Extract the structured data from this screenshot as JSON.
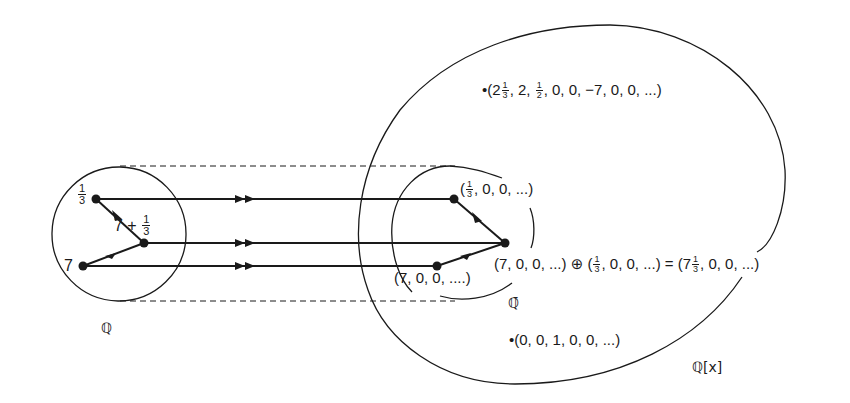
{
  "diagram": {
    "sets": {
      "Q": {
        "label": "ℚ",
        "description": "rational numbers"
      },
      "Q_bar": {
        "label": "ℚ̄",
        "description": "image of Q in Q[x]"
      },
      "Q_x": {
        "label": "ℚ[x]",
        "description": "polynomial ring as sequences"
      }
    },
    "left_points": {
      "one_third": {
        "num": "1",
        "den": "3"
      },
      "seven_plus_third": {
        "prefix": "7 + ",
        "num": "1",
        "den": "3"
      },
      "seven": {
        "text": "7"
      }
    },
    "right_points": {
      "one_third_seq": {
        "open": "(",
        "num": "1",
        "den": "3",
        "rest": ", 0, 0, ...)"
      },
      "seven_seq": {
        "text": "(7, 0, 0, ....)"
      },
      "sum_equation": {
        "lhs": "(7, 0, 0, ...) ⊕ (",
        "num1": "1",
        "den1": "3",
        "mid": ", 0, 0, ...) = (7",
        "num2": "1",
        "den2": "3",
        "rhs": ", 0, 0, ...)"
      }
    },
    "other_points": {
      "seq_a": {
        "bullet": "•",
        "open": "(2",
        "num1": "1",
        "den1": "3",
        "mid1": ", 2, ",
        "num2": "1",
        "den2": "2",
        "rest": ", 0, 0, −7, 0, 0, ...)"
      },
      "seq_b": {
        "bullet": "•",
        "text": "(0, 0, 1, 0, 0, ...)"
      }
    },
    "colors": {
      "ink": "#1a1a1a",
      "background": "#ffffff"
    }
  }
}
